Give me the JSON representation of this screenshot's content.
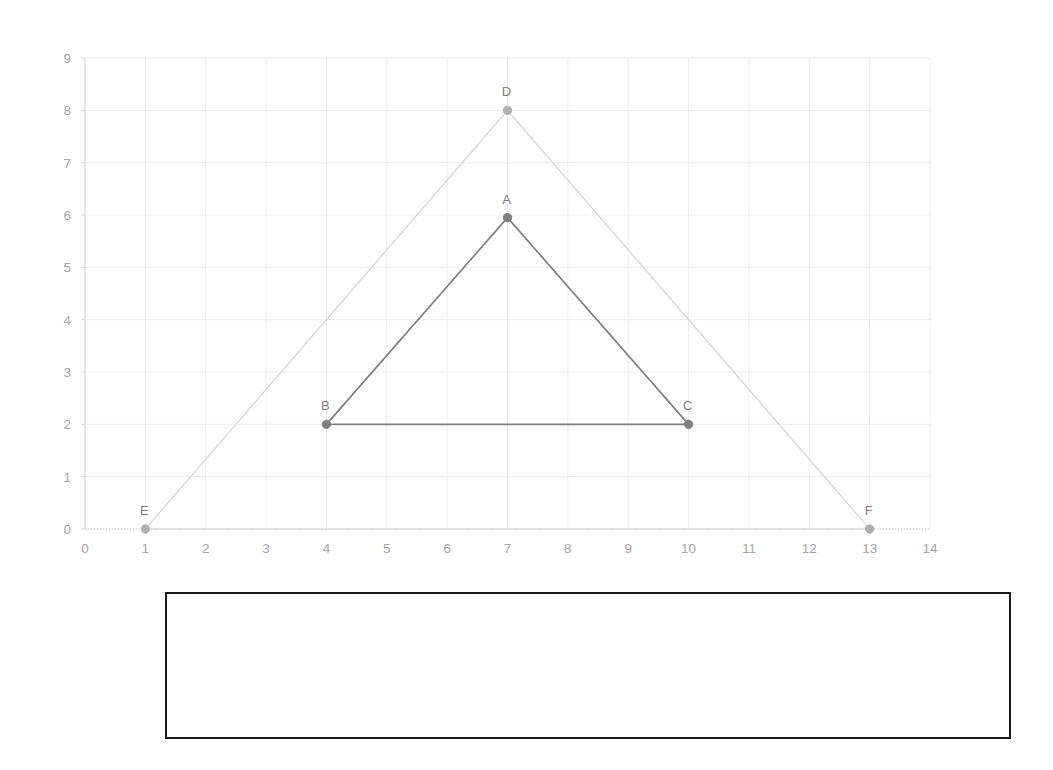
{
  "chart_data": {
    "type": "scatter",
    "title": "",
    "subtitle": "",
    "xlabel": "",
    "ylabel": "",
    "xlim": [
      0,
      14
    ],
    "ylim": [
      0,
      9
    ],
    "grid": true,
    "legend": "none",
    "x_ticks": [
      "0",
      "1",
      "2",
      "3",
      "4",
      "5",
      "6",
      "7",
      "8",
      "9",
      "10",
      "11",
      "12",
      "13",
      "14"
    ],
    "y_ticks": [
      "0",
      "1",
      "2",
      "3",
      "4",
      "5",
      "6",
      "7",
      "8",
      "9"
    ],
    "annotations": [
      "A",
      "B",
      "C",
      "D",
      "E",
      "F"
    ],
    "series": [
      {
        "name": "Outer triangle DEF",
        "color": "#d0d0d0",
        "marker_color": "#b0b0b0",
        "closed": true,
        "points": [
          {
            "label": "D",
            "x": 7,
            "y": 8
          },
          {
            "label": "E",
            "x": 1,
            "y": 0
          },
          {
            "label": "F",
            "x": 13,
            "y": 0
          }
        ]
      },
      {
        "name": "Inner triangle ABC",
        "color": "#808080",
        "marker_color": "#808080",
        "closed": true,
        "points": [
          {
            "label": "A",
            "x": 7,
            "y": 5.95
          },
          {
            "label": "B",
            "x": 4,
            "y": 2
          },
          {
            "label": "C",
            "x": 10,
            "y": 2
          }
        ]
      }
    ],
    "colors": {
      "gridline": "#ededed",
      "axis": "#d9d9d9",
      "tick_text": "#a6a6a6",
      "point_label": "#808080",
      "outer_triangle": "#d0d0d0",
      "inner_triangle": "#808080"
    }
  },
  "note_box": {
    "text": "",
    "border_color": "#1a1a1a"
  }
}
